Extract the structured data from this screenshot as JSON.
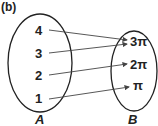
{
  "part_label": "(b)",
  "set_a": {
    "name": "A",
    "elements": [
      "4",
      "3",
      "2",
      "1"
    ]
  },
  "set_b": {
    "name": "B",
    "elements": [
      "3π",
      "2π",
      "π"
    ]
  },
  "mappings": [
    {
      "from": "4",
      "to": "3π"
    },
    {
      "from": "3",
      "to": "3π"
    },
    {
      "from": "2",
      "to": "2π"
    },
    {
      "from": "1",
      "to": "π"
    }
  ]
}
